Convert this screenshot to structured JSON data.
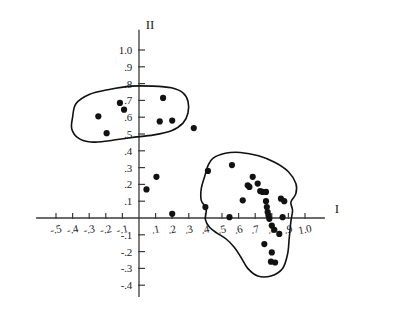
{
  "chart_data": {
    "type": "scatter",
    "title": "",
    "subtitle": "",
    "xlabel": "I",
    "ylabel": "II",
    "grid": false,
    "legend": null,
    "xlim": [
      -0.62,
      1.12
    ],
    "ylim": [
      -0.47,
      1.12
    ],
    "xticks": [
      -0.5,
      -0.4,
      -0.3,
      -0.2,
      -0.1,
      0.1,
      0.2,
      0.3,
      0.4,
      0.5,
      0.6,
      0.7,
      0.8,
      0.9,
      1.0
    ],
    "xtick_labels": [
      "-.5",
      "-.4",
      "-.3",
      "-.2",
      "-.1",
      ".1",
      ".2",
      ".3",
      ".4",
      ".5",
      ".6",
      ".7",
      ".8",
      ".9",
      "1.0"
    ],
    "yticks": [
      -0.4,
      -0.3,
      -0.2,
      -0.1,
      0.1,
      0.2,
      0.3,
      0.4,
      0.5,
      0.6,
      0.7,
      0.8,
      0.9,
      1.0
    ],
    "ytick_labels": [
      "-.4",
      "-.3",
      "-.2",
      "-.1",
      ".1",
      ".2",
      ".3",
      ".4",
      ".5",
      ".6",
      ".7",
      ".8",
      ".9",
      "1.0"
    ],
    "points": [
      [
        -0.245,
        0.605
      ],
      [
        -0.195,
        0.505
      ],
      [
        -0.115,
        0.685
      ],
      [
        -0.09,
        0.645
      ],
      [
        0.145,
        0.715
      ],
      [
        0.125,
        0.575
      ],
      [
        0.2,
        0.58
      ],
      [
        0.045,
        0.17
      ],
      [
        0.105,
        0.245
      ],
      [
        0.2,
        0.025
      ],
      [
        0.33,
        0.535
      ],
      [
        0.415,
        0.28
      ],
      [
        0.4,
        0.065
      ],
      [
        0.56,
        0.315
      ],
      [
        0.545,
        0.005
      ],
      [
        0.685,
        0.245
      ],
      [
        0.655,
        0.195
      ],
      [
        0.665,
        0.185
      ],
      [
        0.715,
        0.205
      ],
      [
        0.73,
        0.16
      ],
      [
        0.745,
        0.155
      ],
      [
        0.765,
        0.155
      ],
      [
        0.625,
        0.105
      ],
      [
        0.765,
        0.1
      ],
      [
        0.77,
        0.065
      ],
      [
        0.775,
        0.035
      ],
      [
        0.78,
        0.015
      ],
      [
        0.785,
        -0.005
      ],
      [
        0.8,
        -0.045
      ],
      [
        0.815,
        -0.07
      ],
      [
        0.845,
        -0.095
      ],
      [
        0.855,
        0.115
      ],
      [
        0.875,
        0.1
      ],
      [
        0.865,
        0.005
      ],
      [
        0.755,
        -0.155
      ],
      [
        0.8,
        -0.205
      ],
      [
        0.795,
        -0.26
      ],
      [
        0.82,
        -0.265
      ]
    ],
    "annotations": [
      {
        "name": "upper-left-cluster-outline",
        "shape": "closed-curve",
        "description": "hand-drawn elongated loop enclosing 7 points in the upper-left quadrant",
        "path_points": [
          [
            -0.4,
            0.6
          ],
          [
            -0.38,
            0.68
          ],
          [
            -0.3,
            0.735
          ],
          [
            -0.18,
            0.765
          ],
          [
            -0.05,
            0.785
          ],
          [
            0.08,
            0.785
          ],
          [
            0.195,
            0.775
          ],
          [
            0.265,
            0.745
          ],
          [
            0.295,
            0.695
          ],
          [
            0.295,
            0.625
          ],
          [
            0.265,
            0.565
          ],
          [
            0.195,
            0.52
          ],
          [
            0.09,
            0.495
          ],
          [
            -0.05,
            0.478
          ],
          [
            -0.18,
            0.46
          ],
          [
            -0.29,
            0.452
          ],
          [
            -0.365,
            0.475
          ],
          [
            -0.405,
            0.53
          ]
        ]
      },
      {
        "name": "right-cluster-outline",
        "shape": "closed-curve",
        "description": "hand-drawn irregular loop enclosing the large right-hand cluster, extending below the x-axis",
        "path_points": [
          [
            0.415,
            0.31
          ],
          [
            0.445,
            0.355
          ],
          [
            0.52,
            0.385
          ],
          [
            0.61,
            0.39
          ],
          [
            0.72,
            0.37
          ],
          [
            0.82,
            0.33
          ],
          [
            0.9,
            0.275
          ],
          [
            0.945,
            0.205
          ],
          [
            0.945,
            0.145
          ],
          [
            0.915,
            0.095
          ],
          [
            0.925,
            0.045
          ],
          [
            0.915,
            -0.02
          ],
          [
            0.905,
            -0.12
          ],
          [
            0.895,
            -0.215
          ],
          [
            0.865,
            -0.3
          ],
          [
            0.795,
            -0.345
          ],
          [
            0.715,
            -0.345
          ],
          [
            0.655,
            -0.3
          ],
          [
            0.615,
            -0.235
          ],
          [
            0.575,
            -0.175
          ],
          [
            0.525,
            -0.125
          ],
          [
            0.47,
            -0.09
          ],
          [
            0.425,
            -0.055
          ],
          [
            0.4,
            -0.01
          ],
          [
            0.405,
            0.055
          ],
          [
            0.375,
            0.105
          ],
          [
            0.375,
            0.175
          ],
          [
            0.395,
            0.245
          ]
        ]
      }
    ]
  },
  "axes": {
    "x_axis_name": "I",
    "y_axis_name": "II"
  }
}
